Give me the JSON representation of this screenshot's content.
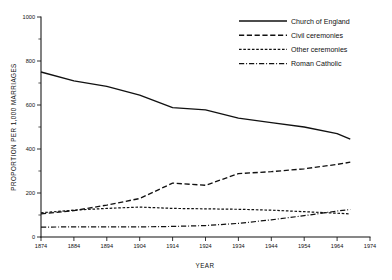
{
  "chart_data": {
    "type": "line",
    "title": "",
    "xlabel": "YEAR",
    "ylabel": "PROPORTION PER 1,000 MARRIAGES",
    "xlim": [
      1874,
      1974
    ],
    "ylim": [
      0,
      1000
    ],
    "xticks": [
      1874,
      1884,
      1894,
      1904,
      1914,
      1924,
      1934,
      1944,
      1954,
      1964,
      1974
    ],
    "xtick_labels": [
      "1874",
      "1884",
      "1894",
      "1904",
      "1914",
      "1924",
      "1934",
      "1944",
      "1954",
      "1964",
      "1974"
    ],
    "yticks": [
      0,
      200,
      400,
      600,
      800,
      1000
    ],
    "ytick_labels": [
      "0",
      "200",
      "400",
      "600",
      "800",
      "1000"
    ],
    "yticks_minor": [
      100,
      300,
      500,
      700,
      900
    ],
    "grid": false,
    "legend_position": "top-right",
    "series": [
      {
        "name": "Church of England",
        "style": "solid",
        "x": [
          1874,
          1884,
          1894,
          1904,
          1914,
          1924,
          1934,
          1944,
          1954,
          1964,
          1968
        ],
        "values": [
          750,
          710,
          685,
          645,
          588,
          578,
          540,
          520,
          500,
          470,
          445
        ]
      },
      {
        "name": "Civil ceremonies",
        "style": "dash-long",
        "x": [
          1874,
          1884,
          1894,
          1904,
          1914,
          1924,
          1934,
          1944,
          1954,
          1964,
          1968
        ],
        "values": [
          105,
          120,
          145,
          175,
          245,
          235,
          288,
          297,
          310,
          330,
          340
        ]
      },
      {
        "name": "Other ceremonies",
        "style": "dash-short",
        "x": [
          1874,
          1884,
          1894,
          1904,
          1914,
          1924,
          1934,
          1944,
          1954,
          1964,
          1968
        ],
        "values": [
          110,
          122,
          130,
          136,
          130,
          128,
          126,
          122,
          115,
          108,
          105
        ]
      },
      {
        "name": "Roman Catholic",
        "style": "dash-dot",
        "x": [
          1874,
          1884,
          1894,
          1904,
          1914,
          1924,
          1934,
          1944,
          1954,
          1964,
          1968
        ],
        "values": [
          45,
          46,
          46,
          46,
          48,
          52,
          62,
          78,
          97,
          118,
          125
        ]
      }
    ]
  },
  "legend": {
    "items": [
      {
        "label": "Church of England",
        "style": "solid"
      },
      {
        "label": "Civil ceremonies",
        "style": "dash-long"
      },
      {
        "label": "Other ceremonies",
        "style": "dash-short"
      },
      {
        "label": "Roman Catholic",
        "style": "dash-dot"
      }
    ]
  },
  "axes": {
    "x_title": "YEAR",
    "y_title": "PROPORTION PER 1,000 MARRIAGES"
  }
}
